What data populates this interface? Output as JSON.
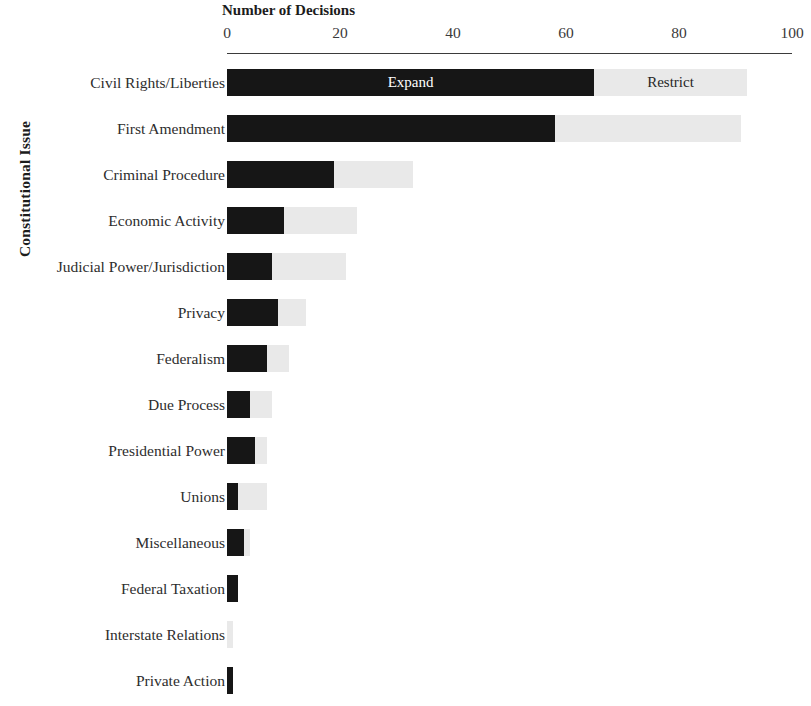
{
  "chart_data": {
    "type": "bar",
    "orientation": "horizontal",
    "stacked": true,
    "title": "",
    "xlabel": "Number of Decisions",
    "ylabel": "Constitutional Issue",
    "xlim": [
      0,
      100
    ],
    "xticks": [
      0,
      20,
      40,
      60,
      80,
      100
    ],
    "xtick_labels": [
      "0",
      "20",
      "40",
      "60",
      "80",
      "100"
    ],
    "grid": false,
    "legend_position": "inline-first-bar",
    "categories": [
      "Civil Rights/Liberties",
      "First Amendment",
      "Criminal Procedure",
      "Economic Activity",
      "Judicial Power/Jurisdiction",
      "Privacy",
      "Federalism",
      "Due Process",
      "Presidential Power",
      "Unions",
      "Miscellaneous",
      "Federal Taxation",
      "Interstate Relations",
      "Private Action"
    ],
    "series": [
      {
        "name": "Expand",
        "color": "#161616",
        "values": [
          65,
          58,
          19,
          10,
          8,
          9,
          7,
          4,
          5,
          2,
          3,
          2,
          0,
          1
        ]
      },
      {
        "name": "Restrict",
        "color": "#e9e9e9",
        "values": [
          27,
          33,
          14,
          13,
          13,
          5,
          4,
          4,
          2,
          5,
          1,
          0,
          1,
          0
        ]
      }
    ],
    "annotations": [
      {
        "text": "Expand",
        "series": "Expand",
        "row": 0,
        "style": "on-dark"
      },
      {
        "text": "Restrict",
        "series": "Restrict",
        "row": 0,
        "style": "on-light"
      }
    ]
  },
  "colors": {
    "expand": "#161616",
    "restrict": "#e9e9e9",
    "axis": "#3b3b3b",
    "text": "#2d2d2d",
    "background": "#ffffff"
  }
}
